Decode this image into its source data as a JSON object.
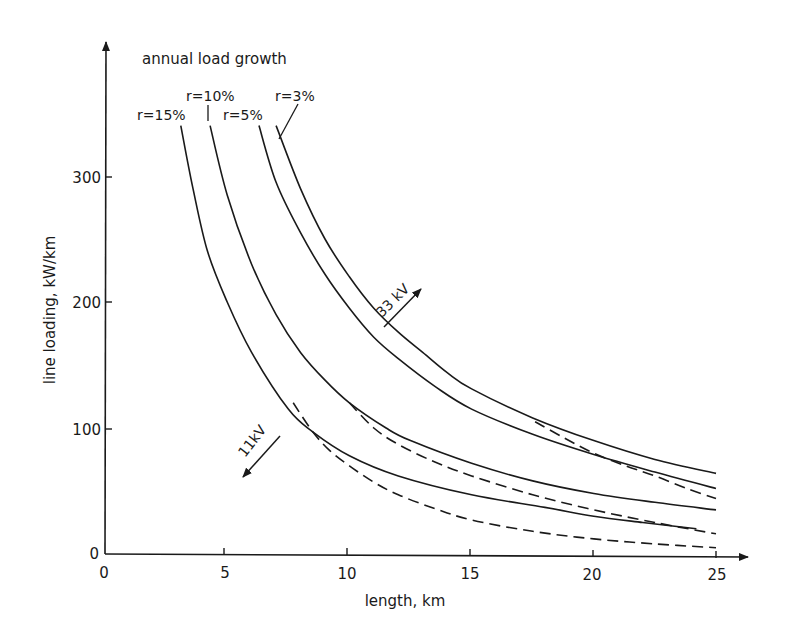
{
  "chart_data": {
    "type": "line",
    "title": "annual load growth",
    "xlabel": "length, km",
    "ylabel": "line loading, kW/km",
    "xlim": [
      0,
      25
    ],
    "ylim": [
      0,
      350
    ],
    "x_ticks": [
      "0",
      "5",
      "10",
      "15",
      "20",
      "25"
    ],
    "y_ticks": [
      "0",
      "100",
      "200",
      "300"
    ],
    "grid": false,
    "legend": "inline curve labels at top",
    "series": [
      {
        "name": "r = 15%",
        "label": "r=15%",
        "style": "solid",
        "points": [
          [
            3.1,
            340
          ],
          [
            3.6,
            290
          ],
          [
            4.2,
            240
          ],
          [
            5,
            200
          ],
          [
            6,
            160
          ],
          [
            7.5,
            115
          ],
          [
            8.5,
            97
          ],
          [
            10,
            78
          ],
          [
            12,
            62
          ],
          [
            15,
            47
          ],
          [
            18,
            37
          ],
          [
            20,
            30
          ],
          [
            22,
            25
          ],
          [
            24.2,
            20
          ]
        ]
      },
      {
        "name": "r = 10%",
        "label": "r=10%",
        "style": "solid",
        "points": [
          [
            4.3,
            340
          ],
          [
            5,
            285
          ],
          [
            6,
            230
          ],
          [
            7,
            190
          ],
          [
            8,
            160
          ],
          [
            9,
            138
          ],
          [
            10,
            120
          ],
          [
            11.5,
            100
          ],
          [
            12.5,
            90
          ],
          [
            15,
            72
          ],
          [
            17.5,
            58
          ],
          [
            20,
            48
          ],
          [
            22.5,
            41
          ],
          [
            25,
            35
          ]
        ]
      },
      {
        "name": "r = 5%",
        "label": "r=5%",
        "style": "solid",
        "points": [
          [
            6.3,
            340
          ],
          [
            7,
            295
          ],
          [
            8,
            255
          ],
          [
            9,
            222
          ],
          [
            10,
            195
          ],
          [
            11,
            172
          ],
          [
            12,
            155
          ],
          [
            13.5,
            133
          ],
          [
            15,
            115
          ],
          [
            17.5,
            95
          ],
          [
            20,
            79
          ],
          [
            22.5,
            65
          ],
          [
            25,
            52
          ]
        ]
      },
      {
        "name": "r = 3%",
        "label": "r=3%",
        "style": "solid",
        "points": [
          [
            7,
            340
          ],
          [
            8,
            290
          ],
          [
            9,
            250
          ],
          [
            10,
            220
          ],
          [
            11,
            195
          ],
          [
            12,
            176
          ],
          [
            13,
            160
          ],
          [
            14,
            144
          ],
          [
            15,
            131
          ],
          [
            17.5,
            108
          ],
          [
            20,
            90
          ],
          [
            22.5,
            75
          ],
          [
            25,
            64
          ]
        ]
      },
      {
        "name": "11 kV (33kV threshold, upper)",
        "label": "",
        "style": "dashed",
        "points": [
          [
            17.6,
            105
          ],
          [
            18.8,
            92
          ],
          [
            20,
            80
          ],
          [
            21.3,
            70
          ],
          [
            22.5,
            62
          ],
          [
            23.8,
            52
          ],
          [
            25,
            44
          ]
        ]
      },
      {
        "name": "11 kV (middle)",
        "label": "",
        "style": "dashed",
        "points": [
          [
            10,
            120
          ],
          [
            11,
            100
          ],
          [
            12,
            87
          ],
          [
            13.5,
            73
          ],
          [
            15,
            62
          ],
          [
            17.5,
            47
          ],
          [
            20,
            35
          ],
          [
            22.5,
            25
          ],
          [
            25,
            16
          ]
        ]
      },
      {
        "name": "11 kV (lower)",
        "label": "",
        "style": "dashed",
        "points": [
          [
            7.7,
            120
          ],
          [
            8.5,
            97
          ],
          [
            9.2,
            82
          ],
          [
            10,
            70
          ],
          [
            11,
            57
          ],
          [
            12,
            47
          ],
          [
            13.5,
            36
          ],
          [
            15,
            27
          ],
          [
            17.5,
            18
          ],
          [
            20,
            12
          ],
          [
            22.5,
            8
          ],
          [
            25,
            5
          ]
        ]
      }
    ],
    "annotations": [
      {
        "text": "33 kV",
        "direction": "arrow up-right",
        "x": 12.2,
        "y": 185
      },
      {
        "text": "11kV",
        "direction": "arrow down-left",
        "x": 5.8,
        "y": 95
      }
    ]
  },
  "labels": {
    "title": "annual load growth",
    "xlabel": "length, km",
    "ylabel": "line loading, kW/km",
    "r15": "r=15%",
    "r10": "r=10%",
    "r5": "r=5%",
    "r3": "r=3%",
    "kv33": "33 kV",
    "kv11": "11kV",
    "x0": "0",
    "x5": "5",
    "x10": "10",
    "x15": "15",
    "x20": "20",
    "x25": "25",
    "y0": "0",
    "y100": "100",
    "y200": "200",
    "y300": "300"
  }
}
